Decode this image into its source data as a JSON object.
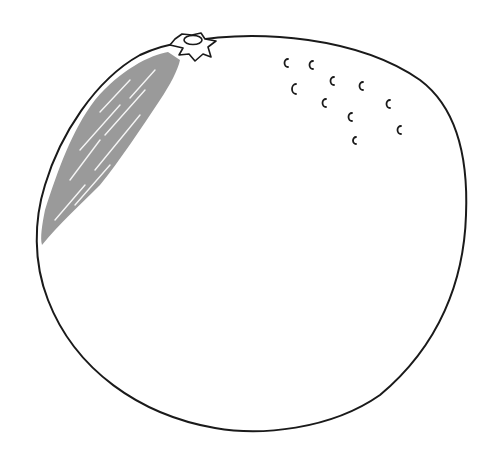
{
  "illustration": {
    "subject": "orange",
    "style": "line-drawing",
    "colors": {
      "background": "#ffffff",
      "outline": "#1a1a1a",
      "shading": "#9a9a9a"
    },
    "parts": [
      "outline",
      "stem",
      "highlight-shading",
      "pore-marks"
    ],
    "pore_mark_count": 13
  }
}
